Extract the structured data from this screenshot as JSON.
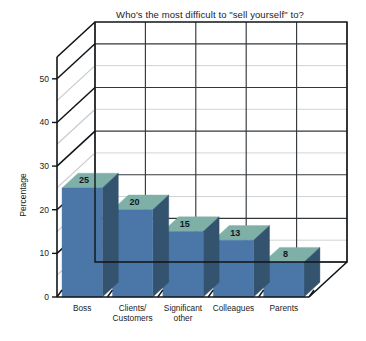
{
  "chart_data": {
    "type": "bar",
    "title": "Who's the most difficult to \"sell yourself\" to?",
    "xlabel": "",
    "ylabel": "Percentage",
    "categories": [
      "Boss",
      "Clients/ Customers",
      "Significant other",
      "Colleagues",
      "Parents"
    ],
    "category_lines": [
      [
        "Boss"
      ],
      [
        "Clients/",
        "Customers"
      ],
      [
        "Significant",
        "other"
      ],
      [
        "Colleagues"
      ],
      [
        "Parents"
      ]
    ],
    "values": [
      25,
      20,
      15,
      13,
      8
    ],
    "value_labels": [
      "25",
      "20",
      "15",
      "13",
      "8"
    ],
    "ylim": [
      0,
      55
    ],
    "y_ticks": [
      0,
      10,
      20,
      30,
      40,
      50
    ],
    "y_tick_labels": [
      "0",
      "10",
      "20",
      "30",
      "40",
      "50"
    ],
    "y_minor_ticks": [
      5,
      15,
      25,
      35,
      45
    ],
    "grid": true,
    "legend": false,
    "legend_position": "none",
    "projection": "3d-isometric",
    "colors": {
      "bar_front": "#4A77A8",
      "bar_top": "#7FB0A8",
      "bar_side": "#33536E",
      "grid_major": "#33383C",
      "grid_minor": "#C9CDD0",
      "axis": "#111417",
      "background": "#FFFFFF",
      "text": "#1B1B1B"
    }
  }
}
